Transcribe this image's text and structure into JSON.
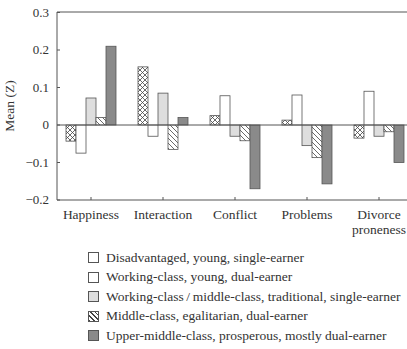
{
  "chart_data": {
    "type": "bar",
    "title": "",
    "xlabel": "",
    "ylabel": "Mean (Z)",
    "ylim": [
      -0.2,
      0.3
    ],
    "yticks": [
      "0.3",
      "0.2",
      "0.1",
      "0",
      "−0.1",
      "−0.2"
    ],
    "grid": false,
    "legend_position": "bottom",
    "categories": [
      "Happiness",
      "Interaction",
      "Conflict",
      "Problems",
      "Divorce proneness"
    ],
    "series": [
      {
        "name": "Disadvantaged, young, single-earner",
        "pattern": "crosshatch",
        "values": [
          -0.043,
          0.155,
          0.025,
          0.013,
          -0.035
        ]
      },
      {
        "name": "Working-class, young, dual-earner",
        "pattern": "white",
        "values": [
          -0.075,
          -0.03,
          0.078,
          0.08,
          0.09
        ]
      },
      {
        "name": "Working-class/middle-class, traditional, single-earner",
        "pattern": "light-gray",
        "values": [
          0.072,
          0.085,
          -0.03,
          -0.055,
          -0.03
        ]
      },
      {
        "name": "Middle-class, egalitarian, dual-earner",
        "pattern": "diagonal-hatch",
        "values": [
          0.02,
          -0.065,
          -0.042,
          -0.087,
          -0.018
        ]
      },
      {
        "name": "Upper-middle-class, prosperous, mostly dual-earner",
        "pattern": "dark-gray",
        "values": [
          0.21,
          0.02,
          -0.17,
          -0.157,
          -0.1
        ]
      }
    ]
  },
  "axis": {
    "ylabel": "Mean (Z)",
    "categories": [
      [
        "Happiness"
      ],
      [
        "Interaction"
      ],
      [
        "Conflict"
      ],
      [
        "Problems"
      ],
      [
        "Divorce",
        "proneness"
      ]
    ]
  },
  "legend": [
    {
      "label": "Disadvantaged, young, single-earner"
    },
    {
      "label": "Working-class, young, dual-earner"
    },
    {
      "label": "Working-class / middle-class, traditional, single-earner"
    },
    {
      "label": "Middle-class, egalitarian, dual-earner"
    },
    {
      "label": "Upper-middle-class, prosperous, mostly dual-earner"
    }
  ],
  "colors": {
    "light_gray": "#dedede",
    "dark_gray": "#8a8a8a",
    "stroke": "#555555"
  }
}
